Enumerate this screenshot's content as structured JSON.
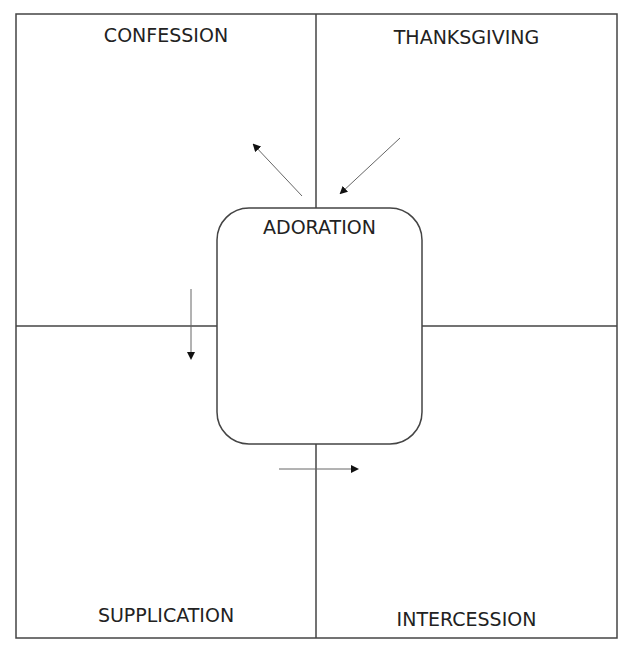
{
  "quadrants": {
    "top_left": "CONFESSION",
    "top_right": "THANKSGIVING",
    "bottom_left": "SUPPLICATION",
    "bottom_right": "INTERCESSION"
  },
  "center": "ADORATION",
  "colors": {
    "line": "#444444",
    "text": "#222222"
  }
}
